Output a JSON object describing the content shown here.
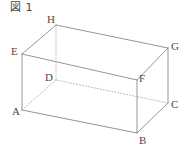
{
  "figure": {
    "caption": "図 1",
    "shape_name": "rectangular-prism",
    "stroke_color": "#8a8a8a",
    "dotted_stroke_color": "#a5a5a5",
    "label_color": "#4a4a4a",
    "background_color": "#ffffff"
  },
  "vertices": [
    {
      "label": "A",
      "x": 22,
      "y": 110,
      "label_x": 12,
      "label_y": 106,
      "hidden": false
    },
    {
      "label": "B",
      "x": 137,
      "y": 133,
      "label_x": 139,
      "label_y": 135,
      "hidden": false
    },
    {
      "label": "C",
      "x": 168,
      "y": 103,
      "label_x": 171,
      "label_y": 99,
      "hidden": false
    },
    {
      "label": "D",
      "x": 56,
      "y": 80,
      "label_x": 45,
      "label_y": 72,
      "hidden": true
    },
    {
      "label": "E",
      "x": 22,
      "y": 54,
      "label_x": 11,
      "label_y": 46,
      "hidden": false
    },
    {
      "label": "F",
      "x": 137,
      "y": 80,
      "label_x": 139,
      "label_y": 73,
      "hidden": false
    },
    {
      "label": "G",
      "x": 168,
      "y": 48,
      "label_x": 171,
      "label_y": 41,
      "hidden": false
    },
    {
      "label": "H",
      "x": 56,
      "y": 25,
      "label_x": 47,
      "label_y": 14,
      "hidden": false
    }
  ],
  "edges": [
    {
      "from": "A",
      "to": "B",
      "style": "solid",
      "name": "edge-ab"
    },
    {
      "from": "B",
      "to": "C",
      "style": "solid",
      "name": "edge-bc"
    },
    {
      "from": "A",
      "to": "E",
      "style": "solid",
      "name": "edge-ae"
    },
    {
      "from": "B",
      "to": "F",
      "style": "solid",
      "name": "edge-bf"
    },
    {
      "from": "C",
      "to": "G",
      "style": "solid",
      "name": "edge-cg"
    },
    {
      "from": "E",
      "to": "F",
      "style": "solid",
      "name": "edge-ef"
    },
    {
      "from": "F",
      "to": "G",
      "style": "solid",
      "name": "edge-fg"
    },
    {
      "from": "E",
      "to": "H",
      "style": "solid",
      "name": "edge-eh"
    },
    {
      "from": "H",
      "to": "G",
      "style": "solid",
      "name": "edge-hg"
    },
    {
      "from": "A",
      "to": "D",
      "style": "dotted",
      "name": "edge-ad"
    },
    {
      "from": "D",
      "to": "C",
      "style": "dotted",
      "name": "edge-dc"
    },
    {
      "from": "D",
      "to": "H",
      "style": "dotted",
      "name": "edge-dh"
    }
  ]
}
